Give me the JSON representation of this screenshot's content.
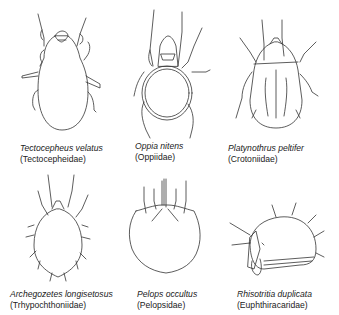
{
  "figure": {
    "specimens": [
      {
        "species": "Tectocepheus velatus",
        "family": "(Tectocepheidae)"
      },
      {
        "species": "Oppia nitens",
        "family": "(Oppiidae)"
      },
      {
        "species": "Platynothrus peltifer",
        "family": "(Crotoniidae)"
      },
      {
        "species": "Archegozetes longisetosus",
        "family": "(Trhypochthoniidae)"
      },
      {
        "species": "Pelops occultus",
        "family": "(Pelopsidae)"
      },
      {
        "species": "Rhisotritia duplicata",
        "family": "(Euphthiracaridae)"
      }
    ]
  }
}
